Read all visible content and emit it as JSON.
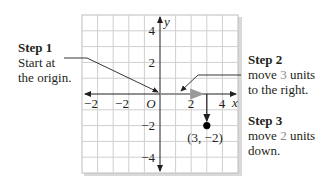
{
  "diagram": {
    "grid": {
      "xmin": -5,
      "xmax": 5,
      "ymin": -5,
      "ymax": 5
    },
    "axis_labels": {
      "x": "x",
      "y": "y",
      "origin": "O"
    },
    "x_ticks": [
      "−2",
      "−2",
      "2",
      "4"
    ],
    "y_ticks": [
      "4",
      "2",
      "−2",
      "−4"
    ],
    "point": {
      "label": "(3, −2)",
      "x": 3,
      "y": -2
    },
    "colors": {
      "grid": "#c8c8c8",
      "axis": "#231f20",
      "move_right_arrow": "#9a9a9a",
      "highlight_num": "#8a8a8a"
    }
  },
  "steps": [
    {
      "title": "Step 1",
      "line1": "Start at",
      "line2": "the origin."
    },
    {
      "title": "Step 2",
      "line1_pre": "move ",
      "num": "3",
      "line1_post": " units",
      "line2": "to the right."
    },
    {
      "title": "Step 3",
      "line1_pre": "move ",
      "num": "2",
      "line1_post": " units",
      "line2": "down."
    }
  ]
}
